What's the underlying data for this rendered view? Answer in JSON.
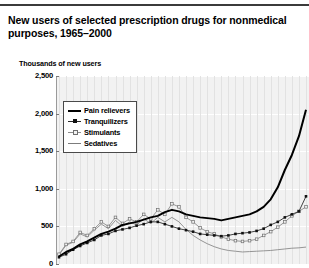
{
  "header": {
    "title": "New users of selected prescription drugs for nonmedical purposes, 1965–2000",
    "rule_color": "#3b3b3b"
  },
  "axis": {
    "y_label": "Thousands of new users",
    "y_ticks": [
      "2,500",
      "2,000",
      "1,500",
      "1,000",
      "500",
      "0"
    ]
  },
  "legend": {
    "items": [
      {
        "label": "Pain relievers",
        "key": "k-pain",
        "color": "#000000"
      },
      {
        "label": "Tranquilizers",
        "key": "k-tranq",
        "color": "#1a1a1a"
      },
      {
        "label": "Stimulants",
        "key": "k-stim",
        "color": "#8d8d8d"
      },
      {
        "label": "Sedatives",
        "key": "k-sed",
        "color": "#7c7c7c"
      }
    ]
  },
  "chart_data": {
    "type": "line",
    "title": "New users of selected prescription drugs for nonmedical purposes, 1965–2000",
    "xlabel": "",
    "ylabel": "Thousands of new users",
    "ylim": [
      0,
      2500
    ],
    "yticks": [
      0,
      500,
      1000,
      1500,
      2000,
      2500
    ],
    "xlim": [
      1965,
      2000
    ],
    "grid": true,
    "legend_position": "upper-left-inside",
    "x": [
      1965,
      1966,
      1967,
      1968,
      1969,
      1970,
      1971,
      1972,
      1973,
      1974,
      1975,
      1976,
      1977,
      1978,
      1979,
      1980,
      1981,
      1982,
      1983,
      1984,
      1985,
      1986,
      1987,
      1988,
      1989,
      1990,
      1991,
      1992,
      1993,
      1994,
      1995,
      1996,
      1997,
      1998,
      1999,
      2000
    ],
    "series": [
      {
        "name": "Pain relievers",
        "values": [
          100,
          160,
          200,
          260,
          300,
          350,
          400,
          430,
          470,
          520,
          540,
          560,
          590,
          620,
          640,
          690,
          720,
          700,
          660,
          640,
          620,
          610,
          600,
          580,
          600,
          620,
          640,
          660,
          700,
          760,
          860,
          1020,
          1250,
          1450,
          1700,
          2050
        ]
      },
      {
        "name": "Tranquilizers",
        "values": [
          90,
          130,
          190,
          240,
          280,
          320,
          380,
          400,
          440,
          460,
          480,
          510,
          530,
          560,
          560,
          530,
          500,
          470,
          450,
          430,
          400,
          390,
          380,
          370,
          380,
          400,
          410,
          420,
          440,
          470,
          520,
          560,
          620,
          660,
          700,
          900
        ]
      },
      {
        "name": "Stimulants",
        "values": [
          130,
          260,
          300,
          420,
          380,
          470,
          560,
          500,
          620,
          540,
          600,
          560,
          660,
          600,
          720,
          660,
          800,
          760,
          620,
          560,
          480,
          430,
          400,
          360,
          330,
          310,
          300,
          310,
          330,
          380,
          430,
          490,
          560,
          640,
          700,
          760
        ]
      },
      {
        "name": "Sedatives",
        "values": [
          120,
          250,
          290,
          400,
          360,
          450,
          530,
          470,
          580,
          500,
          560,
          520,
          600,
          540,
          620,
          560,
          620,
          560,
          460,
          380,
          320,
          270,
          230,
          200,
          180,
          170,
          160,
          165,
          170,
          175,
          180,
          190,
          200,
          210,
          215,
          225
        ]
      }
    ]
  }
}
